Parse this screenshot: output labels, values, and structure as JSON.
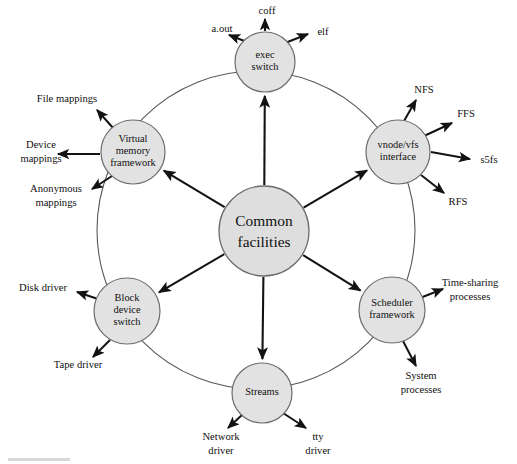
{
  "diagram": {
    "title": "Common facilities",
    "type": "hub-and-spoke kernel architecture diagram",
    "colors": {
      "node_fill": "#e2e2e2",
      "node_stroke": "#6a6e71",
      "ring_stroke": "#55595c",
      "arrow": "#131313",
      "background": "#ffffff",
      "text": "#101010"
    },
    "center": {
      "name": "common-facilities",
      "line1": "Common",
      "line2": "facilities",
      "cx": 264,
      "cy": 231,
      "r": 45
    },
    "ring": {
      "cx": 256,
      "cy": 230,
      "r": 159
    },
    "nodes": [
      {
        "id": "exec-switch",
        "lines": [
          "exec",
          "switch"
        ],
        "cx": 265,
        "cy": 62,
        "r": 30,
        "leaves": [
          {
            "id": "a-out",
            "label": "a.out",
            "lx": 222,
            "ly": 30,
            "anchor": "middle",
            "ax1": 247,
            "ay1": 42,
            "ax2": 229,
            "ay2": 35
          },
          {
            "id": "coff",
            "label": "coff",
            "lx": 267,
            "ly": 12,
            "anchor": "middle",
            "ax1": 265,
            "ay1": 31,
            "ax2": 265,
            "ay2": 19
          },
          {
            "id": "elf",
            "label": "elf",
            "lx": 323,
            "ly": 33,
            "anchor": "middle",
            "ax1": 285,
            "ay1": 43,
            "ax2": 308,
            "ay2": 34
          }
        ]
      },
      {
        "id": "vnode-vfs-interface",
        "lines": [
          "vnode/vfs",
          "interface"
        ],
        "cx": 398,
        "cy": 152,
        "r": 32,
        "leaves": [
          {
            "id": "nfs",
            "label": "NFS",
            "lx": 424,
            "ly": 91,
            "anchor": "middle",
            "ax1": 404,
            "ay1": 121,
            "ax2": 416,
            "ay2": 100
          },
          {
            "id": "ffs",
            "label": "FFS",
            "lx": 466,
            "ly": 115,
            "anchor": "middle",
            "ax1": 424,
            "ay1": 136,
            "ax2": 452,
            "ay2": 123
          },
          {
            "id": "s5fs",
            "label": "s5fs",
            "lx": 489,
            "ly": 161,
            "anchor": "middle",
            "ax1": 431,
            "ay1": 152,
            "ax2": 470,
            "ay2": 159
          },
          {
            "id": "rfs",
            "label": "RFS",
            "lx": 458,
            "ly": 203,
            "anchor": "middle",
            "ax1": 421,
            "ay1": 175,
            "ax2": 444,
            "ay2": 193
          }
        ]
      },
      {
        "id": "scheduler-framework",
        "lines": [
          "Scheduler",
          "framework"
        ],
        "cx": 392,
        "cy": 310,
        "r": 33,
        "leaves": [
          {
            "id": "time-sharing-processes",
            "label": "Time-sharing",
            "label2": "processes",
            "lx": 470,
            "ly": 284,
            "anchor": "middle",
            "ax1": 420,
            "ay1": 298,
            "ax2": 443,
            "ay2": 289
          },
          {
            "id": "system-processes",
            "label": "System",
            "label2": "processes",
            "lx": 421,
            "ly": 377,
            "anchor": "middle",
            "ax1": 403,
            "ay1": 341,
            "ax2": 416,
            "ay2": 366
          }
        ]
      },
      {
        "id": "streams",
        "lines": [
          "Streams"
        ],
        "cx": 262,
        "cy": 393,
        "r": 30,
        "leaves": [
          {
            "id": "network-driver",
            "label": "Network",
            "label2": "driver",
            "lx": 221,
            "ly": 438,
            "anchor": "middle",
            "ax1": 243,
            "ay1": 414,
            "ax2": 228,
            "ay2": 428
          },
          {
            "id": "tty-driver",
            "label": "tty",
            "label2": "driver",
            "lx": 318,
            "ly": 438,
            "anchor": "middle",
            "ax1": 283,
            "ay1": 413,
            "ax2": 306,
            "ay2": 428
          }
        ]
      },
      {
        "id": "block-device-switch",
        "lines": [
          "Block",
          "device",
          "switch"
        ],
        "cx": 127,
        "cy": 311,
        "r": 33,
        "leaves": [
          {
            "id": "disk-driver",
            "label": "Disk driver",
            "lx": 43,
            "ly": 289,
            "anchor": "middle",
            "ax1": 98,
            "ay1": 299,
            "ax2": 77,
            "ay2": 292
          },
          {
            "id": "tape-driver",
            "label": "Tape driver",
            "lx": 78,
            "ly": 366,
            "anchor": "middle",
            "ax1": 110,
            "ay1": 340,
            "ax2": 93,
            "ay2": 357
          }
        ]
      },
      {
        "id": "virtual-memory-framework",
        "lines": [
          "Virtual",
          "memory",
          "framework"
        ],
        "cx": 133,
        "cy": 152,
        "r": 32,
        "leaves": [
          {
            "id": "file-mappings",
            "label": "File mappings",
            "lx": 67,
            "ly": 100,
            "anchor": "middle",
            "ax1": 114,
            "ay1": 129,
            "ax2": 97,
            "ay2": 110
          },
          {
            "id": "device-mappings",
            "label": "Device",
            "label2": "mappings",
            "lx": 41,
            "ly": 146,
            "anchor": "middle",
            "ax1": 100,
            "ay1": 154,
            "ax2": 58,
            "ay2": 154
          },
          {
            "id": "anonymous-mappings",
            "label": "Anonymous",
            "label2": "mappings",
            "lx": 56,
            "ly": 190,
            "anchor": "middle",
            "ax1": 112,
            "ay1": 176,
            "ax2": 92,
            "ay2": 189
          }
        ]
      }
    ]
  }
}
